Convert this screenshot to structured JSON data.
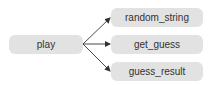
{
  "diagram": {
    "type": "call-graph",
    "nodes": [
      {
        "id": "play",
        "label": "play"
      },
      {
        "id": "random_string",
        "label": "random_string"
      },
      {
        "id": "get_guess",
        "label": "get_guess"
      },
      {
        "id": "guess_result",
        "label": "guess_result"
      }
    ],
    "edges": [
      {
        "from": "play",
        "to": "random_string"
      },
      {
        "from": "play",
        "to": "get_guess"
      },
      {
        "from": "play",
        "to": "guess_result"
      }
    ],
    "colors": {
      "node_fill": "#e2e2e2",
      "edge": "#333333",
      "text": "#333333"
    }
  }
}
